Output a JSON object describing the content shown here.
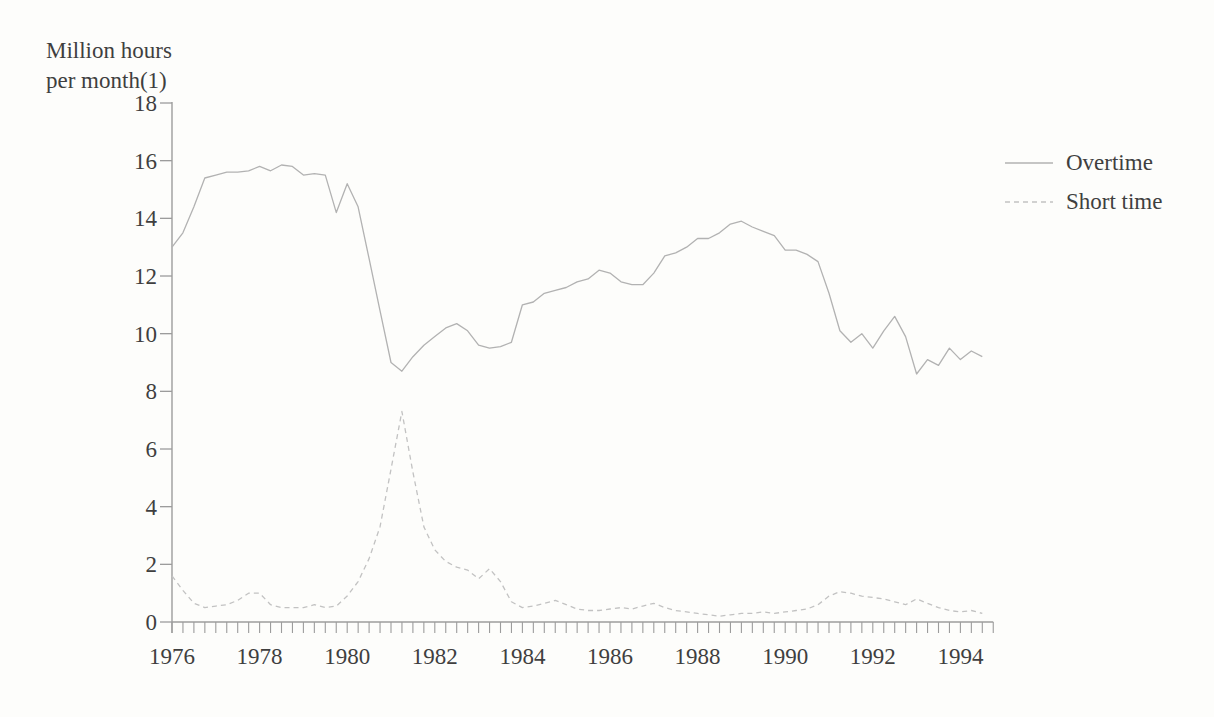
{
  "page": {
    "background": "#fdfdfb"
  },
  "chart_data": {
    "type": "line",
    "title_lines": [
      "Million hours",
      "per month(1)"
    ],
    "xlabel": "",
    "ylabel": "Million hours per month(1)",
    "x_start": 1976,
    "x_step_years": 0.25,
    "x_end": 1994.5,
    "x_label_years": [
      1976,
      1978,
      1980,
      1982,
      1984,
      1986,
      1988,
      1990,
      1992,
      1994
    ],
    "ylim": [
      0,
      18
    ],
    "y_ticks": [
      0,
      2,
      4,
      6,
      8,
      10,
      12,
      14,
      16,
      18
    ],
    "grid": false,
    "legend_position": "right",
    "colors": {
      "axis": "#9c9c9c",
      "text": "#3f3f3f",
      "background": "#fdfdfb"
    },
    "series": [
      {
        "name": "Overtime",
        "line_style": "solid",
        "color": "#b2b2b2",
        "values": [
          13.0,
          13.5,
          14.4,
          15.4,
          15.5,
          15.6,
          15.6,
          15.65,
          15.8,
          15.65,
          15.85,
          15.8,
          15.5,
          15.55,
          15.5,
          14.2,
          15.2,
          14.4,
          12.6,
          10.8,
          9.0,
          8.7,
          9.2,
          9.6,
          9.9,
          10.2,
          10.35,
          10.1,
          9.6,
          9.5,
          9.55,
          9.7,
          11.0,
          11.1,
          11.4,
          11.5,
          11.6,
          11.8,
          11.9,
          12.2,
          12.1,
          11.8,
          11.7,
          11.7,
          12.1,
          12.7,
          12.8,
          13.0,
          13.3,
          13.3,
          13.5,
          13.8,
          13.9,
          13.7,
          13.55,
          13.4,
          12.9,
          12.9,
          12.75,
          12.5,
          11.4,
          10.1,
          9.7,
          10.0,
          9.5,
          10.1,
          10.6,
          9.9,
          8.6,
          9.1,
          8.9,
          9.5,
          9.1,
          9.4,
          9.2
        ]
      },
      {
        "name": "Short time",
        "line_style": "dashed",
        "color": "#c2c2c2",
        "values": [
          1.6,
          1.1,
          0.65,
          0.5,
          0.55,
          0.6,
          0.75,
          1.0,
          1.0,
          0.6,
          0.5,
          0.5,
          0.5,
          0.6,
          0.5,
          0.55,
          0.9,
          1.4,
          2.2,
          3.3,
          5.3,
          7.3,
          5.2,
          3.3,
          2.5,
          2.1,
          1.9,
          1.8,
          1.5,
          1.85,
          1.4,
          0.7,
          0.5,
          0.55,
          0.65,
          0.75,
          0.6,
          0.45,
          0.4,
          0.4,
          0.45,
          0.5,
          0.45,
          0.55,
          0.65,
          0.5,
          0.4,
          0.35,
          0.3,
          0.25,
          0.2,
          0.25,
          0.3,
          0.3,
          0.35,
          0.3,
          0.35,
          0.4,
          0.45,
          0.6,
          0.9,
          1.05,
          1.0,
          0.9,
          0.85,
          0.8,
          0.7,
          0.6,
          0.8,
          0.65,
          0.5,
          0.4,
          0.35,
          0.4,
          0.3
        ]
      }
    ]
  }
}
